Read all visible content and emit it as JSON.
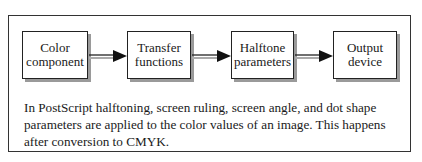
{
  "diagram": {
    "boxes": [
      {
        "label_line1": "Color",
        "label_line2": "component"
      },
      {
        "label_line1": "Transfer",
        "label_line2": "functions"
      },
      {
        "label_line1": "Halftone",
        "label_line2": "parameters"
      },
      {
        "label_line1": "Output",
        "label_line2": "device"
      }
    ],
    "caption": "In PostScript halftoning, screen ruling, screen angle, and dot shape parameters are applied to the color values of an image. This happens after conversion to CMYK."
  }
}
